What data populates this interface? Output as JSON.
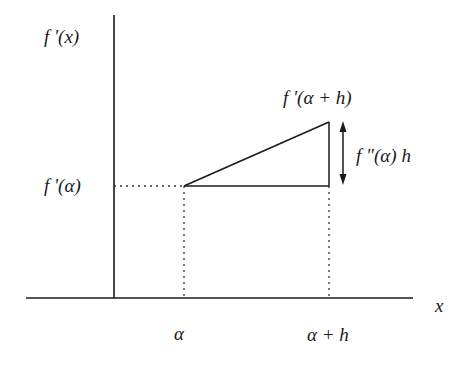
{
  "diagram": {
    "type": "mean-value / Taylor linearization sketch",
    "axes": {
      "y_label": "f '(x)",
      "x_label": "x"
    },
    "labels": {
      "f_prime_alpha": "f '(α)",
      "f_prime_alpha_plus_h": "f '(α + h)",
      "increment": "f \"(α) h",
      "alpha": "α",
      "alpha_plus_h": "α + h"
    },
    "colors": {
      "line": "#1a1a1a",
      "dotted": "#333333",
      "background": "#ffffff"
    }
  }
}
